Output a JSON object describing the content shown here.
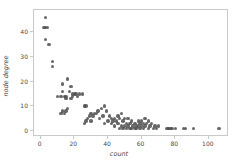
{
  "chart_data": {
    "type": "scatter",
    "title": "",
    "xlabel": "count",
    "ylabel": "node degree",
    "xlim": [
      -4,
      112
    ],
    "ylim": [
      -2.5,
      49
    ],
    "xticks": [
      0,
      20,
      40,
      60,
      80,
      100
    ],
    "xticklabels": [
      "0",
      "20",
      "40",
      "60",
      "80",
      "100"
    ],
    "yticks": [
      0,
      10,
      20,
      30,
      40
    ],
    "yticklabels": [
      "0",
      "10",
      "20",
      "30",
      "40"
    ],
    "grid": false,
    "legend": null,
    "marker_color": "#4d4d4d",
    "marker_size": 3.4,
    "frame_color": "#c9c9c9",
    "background": "#ffffff",
    "points": [
      {
        "x": 3,
        "y": 46
      },
      {
        "x": 2,
        "y": 42
      },
      {
        "x": 3,
        "y": 42
      },
      {
        "x": 4,
        "y": 42
      },
      {
        "x": 3,
        "y": 37
      },
      {
        "x": 5,
        "y": 35
      },
      {
        "x": 7,
        "y": 28
      },
      {
        "x": 7,
        "y": 26
      },
      {
        "x": 16,
        "y": 21
      },
      {
        "x": 13,
        "y": 19
      },
      {
        "x": 18,
        "y": 18
      },
      {
        "x": 13,
        "y": 16
      },
      {
        "x": 17,
        "y": 16
      },
      {
        "x": 19,
        "y": 15
      },
      {
        "x": 20,
        "y": 15
      },
      {
        "x": 21,
        "y": 15
      },
      {
        "x": 23,
        "y": 15
      },
      {
        "x": 25,
        "y": 15
      },
      {
        "x": 10,
        "y": 14
      },
      {
        "x": 12,
        "y": 14
      },
      {
        "x": 14,
        "y": 14
      },
      {
        "x": 15,
        "y": 14
      },
      {
        "x": 19,
        "y": 14
      },
      {
        "x": 22,
        "y": 14
      },
      {
        "x": 15,
        "y": 13
      },
      {
        "x": 18,
        "y": 13
      },
      {
        "x": 26,
        "y": 10
      },
      {
        "x": 27,
        "y": 10
      },
      {
        "x": 38,
        "y": 10
      },
      {
        "x": 16,
        "y": 9
      },
      {
        "x": 36,
        "y": 9
      },
      {
        "x": 13,
        "y": 8
      },
      {
        "x": 15,
        "y": 8
      },
      {
        "x": 34,
        "y": 8
      },
      {
        "x": 39,
        "y": 8
      },
      {
        "x": 12,
        "y": 7
      },
      {
        "x": 14,
        "y": 7
      },
      {
        "x": 30,
        "y": 7
      },
      {
        "x": 32,
        "y": 7
      },
      {
        "x": 33,
        "y": 7
      },
      {
        "x": 48,
        "y": 7
      },
      {
        "x": 29,
        "y": 6
      },
      {
        "x": 31,
        "y": 6
      },
      {
        "x": 37,
        "y": 6
      },
      {
        "x": 41,
        "y": 6
      },
      {
        "x": 46,
        "y": 6
      },
      {
        "x": 28,
        "y": 5
      },
      {
        "x": 35,
        "y": 5
      },
      {
        "x": 42,
        "y": 5
      },
      {
        "x": 44,
        "y": 5
      },
      {
        "x": 47,
        "y": 5
      },
      {
        "x": 50,
        "y": 5
      },
      {
        "x": 52,
        "y": 5
      },
      {
        "x": 62,
        "y": 5
      },
      {
        "x": 27,
        "y": 4
      },
      {
        "x": 30,
        "y": 4
      },
      {
        "x": 40,
        "y": 4
      },
      {
        "x": 43,
        "y": 4
      },
      {
        "x": 45,
        "y": 4
      },
      {
        "x": 49,
        "y": 4
      },
      {
        "x": 54,
        "y": 4
      },
      {
        "x": 58,
        "y": 4
      },
      {
        "x": 60,
        "y": 4
      },
      {
        "x": 64,
        "y": 4
      },
      {
        "x": 26,
        "y": 3
      },
      {
        "x": 38,
        "y": 3
      },
      {
        "x": 42,
        "y": 3
      },
      {
        "x": 46,
        "y": 3
      },
      {
        "x": 51,
        "y": 3
      },
      {
        "x": 53,
        "y": 3
      },
      {
        "x": 56,
        "y": 3
      },
      {
        "x": 59,
        "y": 3
      },
      {
        "x": 61,
        "y": 3
      },
      {
        "x": 63,
        "y": 3
      },
      {
        "x": 66,
        "y": 3
      },
      {
        "x": 44,
        "y": 2
      },
      {
        "x": 48,
        "y": 2
      },
      {
        "x": 50,
        "y": 2
      },
      {
        "x": 52,
        "y": 2
      },
      {
        "x": 55,
        "y": 2
      },
      {
        "x": 57,
        "y": 2
      },
      {
        "x": 58,
        "y": 2
      },
      {
        "x": 60,
        "y": 2
      },
      {
        "x": 62,
        "y": 2
      },
      {
        "x": 65,
        "y": 2
      },
      {
        "x": 68,
        "y": 2
      },
      {
        "x": 70,
        "y": 2
      },
      {
        "x": 47,
        "y": 1
      },
      {
        "x": 49,
        "y": 1
      },
      {
        "x": 51,
        "y": 1
      },
      {
        "x": 53,
        "y": 1
      },
      {
        "x": 54,
        "y": 1
      },
      {
        "x": 56,
        "y": 1
      },
      {
        "x": 57,
        "y": 1
      },
      {
        "x": 59,
        "y": 1
      },
      {
        "x": 61,
        "y": 1
      },
      {
        "x": 64,
        "y": 1
      },
      {
        "x": 67,
        "y": 1
      },
      {
        "x": 69,
        "y": 1
      },
      {
        "x": 75,
        "y": 1
      },
      {
        "x": 76,
        "y": 1
      },
      {
        "x": 77,
        "y": 1
      },
      {
        "x": 78,
        "y": 1
      },
      {
        "x": 80,
        "y": 1
      },
      {
        "x": 85,
        "y": 1
      },
      {
        "x": 86,
        "y": 1
      },
      {
        "x": 91,
        "y": 1
      },
      {
        "x": 106,
        "y": 1
      }
    ]
  }
}
